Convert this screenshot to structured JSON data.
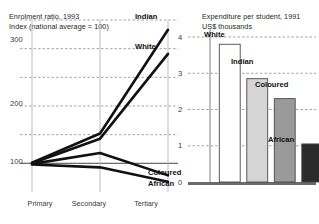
{
  "figure": {
    "background": "#ffffff",
    "divider": false
  },
  "chart_data": [
    {
      "type": "line",
      "title": "Enrolment ratio, 1993",
      "subtitle": "Index (national average = 100)",
      "xlabel": "",
      "ylabel": "",
      "categories": [
        "Primary",
        "Secondary",
        "Tertiary"
      ],
      "ylim": [
        50,
        350
      ],
      "yticks": [
        100,
        200,
        300
      ],
      "ytick_labels": [
        "100",
        "200",
        "300"
      ],
      "gridlines": [
        100,
        150,
        200,
        250,
        300,
        350
      ],
      "grid": true,
      "legend": "inline-end-labels",
      "series": [
        {
          "name": "Indian",
          "values": [
            101,
            152,
            333
          ],
          "color": "#111111",
          "label": "Indian"
        },
        {
          "name": "White",
          "values": [
            100,
            143,
            291
          ],
          "color": "#111111",
          "label": "White"
        },
        {
          "name": "Coloured",
          "values": [
            99,
            118,
            79
          ],
          "color": "#111111",
          "label": "Coloured"
        },
        {
          "name": "African",
          "values": [
            98,
            93,
            68
          ],
          "color": "#111111",
          "label": "African"
        }
      ]
    },
    {
      "type": "bar",
      "title": "Expenditure per student, 1991",
      "subtitle": "US$ thousands",
      "xlabel": "",
      "ylabel": "",
      "categories": [
        "White",
        "Indian",
        "Coloured",
        "African"
      ],
      "values": [
        3.8,
        2.85,
        2.3,
        1.05
      ],
      "ylim": [
        0,
        4
      ],
      "yticks": [
        0,
        1,
        2,
        3,
        4
      ],
      "ytick_labels": [
        "0",
        "1",
        "2",
        "3",
        "4"
      ],
      "grid": true,
      "bar_colors": [
        "#ffffff",
        "#d5d5d5",
        "#9a9a9a",
        "#2b2b2b"
      ],
      "bar_edge": "#4a4a4a",
      "legend": "above-bar-labels"
    }
  ]
}
